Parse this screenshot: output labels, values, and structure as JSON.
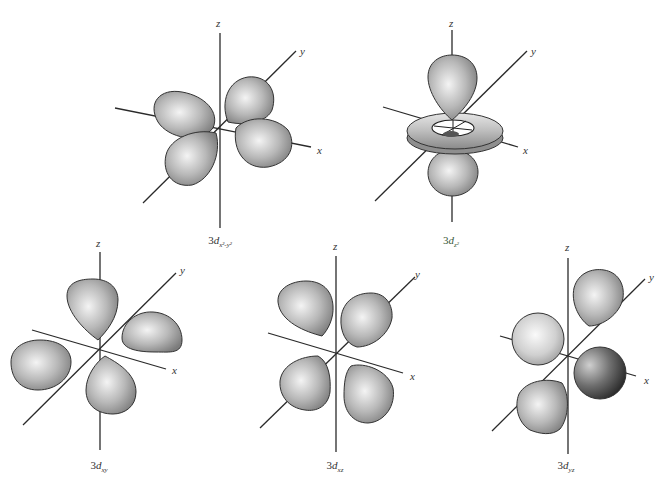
{
  "figure": {
    "colors": {
      "background": "#ffffff",
      "axis": "#2a2a2a",
      "lobe_light": "#f2f2f2",
      "lobe_mid": "#b5b5b5",
      "lobe_dark": "#7a7a7a",
      "lobe_dark_shaded": "#3a3a3a"
    },
    "axis_labels": {
      "x": "x",
      "y": "y",
      "z": "z"
    },
    "orbitals": [
      {
        "id": "dx2y2",
        "prefix": "3",
        "d": "d",
        "subscript": "x²-y²",
        "label": "3d x²−y²",
        "position": "top-left"
      },
      {
        "id": "dz2",
        "prefix": "3",
        "d": "d",
        "subscript": "z²",
        "label": "3d z²",
        "position": "top-right"
      },
      {
        "id": "dxy",
        "prefix": "3",
        "d": "d",
        "subscript": "xy",
        "label": "3d xy",
        "position": "bottom-left"
      },
      {
        "id": "dxz",
        "prefix": "3",
        "d": "d",
        "subscript": "xz",
        "label": "3d xz",
        "position": "bottom-center"
      },
      {
        "id": "dyz",
        "prefix": "3",
        "d": "d",
        "subscript": "yz",
        "label": "3d yz",
        "position": "bottom-right"
      }
    ]
  }
}
